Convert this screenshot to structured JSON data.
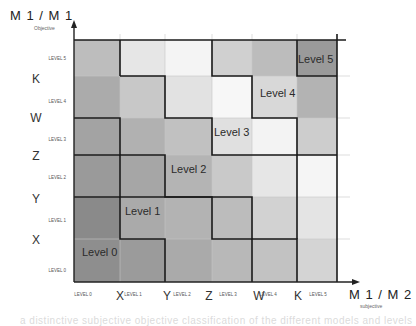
{
  "y_axis": {
    "title": "M 1 / M 1",
    "subtitle": "Objective",
    "small_labels": [
      "LEVEL 5",
      "LEVEL 4",
      "LEVEL 3",
      "LEVEL 2",
      "LEVEL 1",
      "LEVEL 0"
    ],
    "big_labels": [
      "K",
      "W",
      "Z",
      "Y",
      "X"
    ]
  },
  "x_axis": {
    "title": "M 1 / M 2",
    "subtitle": "subjective",
    "small_labels": [
      "LEVEL 0",
      "LEVEL 1",
      "LEVEL 2",
      "LEVEL 3",
      "LEVEL 4",
      "LEVEL 5"
    ],
    "big_labels": [
      "X",
      "Y",
      "Z",
      "W",
      "K"
    ]
  },
  "levels": [
    "Level 0",
    "Level 1",
    "Level 2",
    "Level 3",
    "Level 4",
    "Level 5"
  ],
  "grid": {
    "rows_top_to_bottom": [
      [
        "#bdbdbd",
        "#e6e6e6",
        "#f4f4f4",
        "#d0d0d0",
        "#bcbcbc",
        "#9a9a9a"
      ],
      [
        "#ababab",
        "#c8c8c8",
        "#e2e2e2",
        "#f7f7f7",
        "#d8d8d8",
        "#b3b3b3"
      ],
      [
        "#a3a3a3",
        "#b1b1b1",
        "#c1c1c1",
        "#e0e0e0",
        "#f3f3f3",
        "#cdcdcd"
      ],
      [
        "#9a9a9a",
        "#a6a6a6",
        "#b4b4b4",
        "#c9c9c9",
        "#e6e6e6",
        "#f5f5f5"
      ],
      [
        "#8a8a8a",
        "#aaaaaa",
        "#b3b3b3",
        "#bcbcbc",
        "#d2d2d2",
        "#e4e4e4"
      ],
      [
        "#8e8e8e",
        "#9b9b9b",
        "#aaaaaa",
        "#b8b8b8",
        "#c2c2c2",
        "#d4d4d4"
      ]
    ]
  },
  "caption": "a distinctive subjective objective classification of the different models and levels"
}
